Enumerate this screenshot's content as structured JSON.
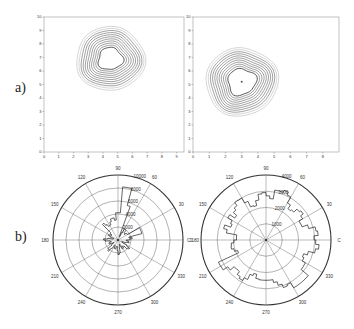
{
  "labels": {
    "a": "a)",
    "b": "b)"
  },
  "chart_data": [
    {
      "type": "contour",
      "panel": "a-left",
      "xlim": [
        0,
        9.5
      ],
      "ylim": [
        0,
        10
      ],
      "xticks": [
        "0",
        "1",
        "2",
        "3",
        "4",
        "5",
        "6",
        "7",
        "8",
        "9"
      ],
      "yticks": [
        "0",
        "1",
        "2",
        "3",
        "4",
        "5",
        "6",
        "7",
        "8",
        "9",
        "10"
      ],
      "center": [
        4.5,
        7.0
      ],
      "levels": 11
    },
    {
      "type": "contour",
      "panel": "a-right",
      "xlim": [
        0,
        9
      ],
      "ylim": [
        0,
        10
      ],
      "xticks": [
        "0",
        "1",
        "2",
        "3",
        "4",
        "5",
        "6",
        "7",
        "8"
      ],
      "yticks": [
        "0",
        "1",
        "2",
        "3",
        "4",
        "5",
        "6",
        "7",
        "8",
        "9",
        "10"
      ],
      "center": [
        3.0,
        5.2
      ],
      "levels": 11
    },
    {
      "type": "polar",
      "panel": "b-left",
      "angle_labels": [
        "0",
        "30",
        "60",
        "90",
        "120",
        "150",
        "180",
        "210",
        "240",
        "270",
        "300",
        "330"
      ],
      "radial_labels": [
        "2000",
        "4000",
        "6000",
        "8000",
        "10000"
      ],
      "rmax": 10000,
      "dominant_direction_deg": 80
    },
    {
      "type": "polar",
      "panel": "b-right",
      "angle_labels": [
        "0",
        "30",
        "60",
        "90",
        "120",
        "150",
        "180",
        "210",
        "240",
        "270",
        "300",
        "330"
      ],
      "radial_labels": [
        "1000",
        "2000",
        "3000",
        "4000"
      ],
      "rmax": 4000,
      "dominant_direction_deg": 75
    }
  ],
  "axes": {
    "left_contour": {
      "xticks": [
        "0",
        "1",
        "2",
        "3",
        "4",
        "5",
        "6",
        "7",
        "8",
        "9"
      ],
      "yticks": [
        "0",
        "1",
        "2",
        "3",
        "4",
        "5",
        "6",
        "7",
        "8",
        "9",
        "10"
      ]
    },
    "right_contour": {
      "xticks": [
        "0",
        "1",
        "2",
        "3",
        "4",
        "5",
        "6",
        "7",
        "8"
      ],
      "yticks": [
        "0",
        "1",
        "2",
        "3",
        "4",
        "5",
        "6",
        "7",
        "8",
        "9",
        "10"
      ]
    }
  },
  "polar_left": {
    "angles": [
      {
        "deg": 90,
        "label": "90"
      },
      {
        "deg": 60,
        "label": "60"
      },
      {
        "deg": 30,
        "label": "30"
      },
      {
        "deg": 0,
        "label": "0"
      },
      {
        "deg": 330,
        "label": "330"
      },
      {
        "deg": 300,
        "label": "300"
      },
      {
        "deg": 270,
        "label": "270"
      },
      {
        "deg": 240,
        "label": "240"
      },
      {
        "deg": 210,
        "label": "210"
      },
      {
        "deg": 180,
        "label": "180"
      },
      {
        "deg": 150,
        "label": "150"
      },
      {
        "deg": 120,
        "label": "120"
      }
    ],
    "radial": [
      "2000",
      "4000",
      "6000",
      "8000",
      "10000"
    ]
  },
  "polar_right": {
    "angles": [
      {
        "deg": 90,
        "label": "90"
      },
      {
        "deg": 60,
        "label": "60"
      },
      {
        "deg": 30,
        "label": "30"
      },
      {
        "deg": 0,
        "label": "C"
      },
      {
        "deg": 330,
        "label": "330"
      },
      {
        "deg": 300,
        "label": "300"
      },
      {
        "deg": 270,
        "label": "270"
      },
      {
        "deg": 240,
        "label": "240"
      },
      {
        "deg": 210,
        "label": "210"
      },
      {
        "deg": 180,
        "label": "C 180"
      },
      {
        "deg": 150,
        "label": "150"
      },
      {
        "deg": 120,
        "label": "120"
      }
    ],
    "radial": [
      "1000",
      "2000",
      "3000",
      "4000"
    ]
  }
}
